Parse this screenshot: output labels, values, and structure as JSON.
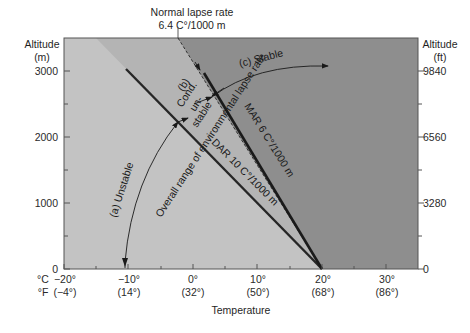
{
  "diagram": {
    "title_annotation": {
      "line1": "Normal lapse rate",
      "line2": "6.4 C°/1000 m"
    },
    "left_axis": {
      "label_line1": "Altitude",
      "label_line2": "(m)",
      "ticks": [
        "0",
        "1000",
        "2000",
        "3000"
      ]
    },
    "right_axis": {
      "label_line1": "Altitude",
      "label_line2": "(ft)",
      "ticks": [
        "0",
        "3280",
        "6560",
        "9840"
      ]
    },
    "bottom_axis": {
      "celsius_unit": "°C",
      "fahrenheit_unit": "°F",
      "celsius_ticks": [
        "−20°",
        "−10°",
        "0°",
        "10°",
        "20°",
        "30°"
      ],
      "fahrenheit_ticks": [
        "(−4°)",
        "(14°)",
        "(32°)",
        "(50°)",
        "(68°)",
        "(86°)"
      ],
      "title": "Temperature"
    },
    "regions": {
      "unstable_label": "(a) Unstable",
      "cond_unstable_label_1": "(b)",
      "cond_unstable_label_2": "Cond.",
      "cond_unstable_label_3": "un-",
      "cond_unstable_label_4": "stable",
      "stable_label": "(c) Stable",
      "overall_range_label": "Overall range of environmental lapse rate"
    },
    "lines": {
      "dar_label": "DAR 10 C°/1000 m",
      "mar_label": "MAR 6 C°/1000 m"
    },
    "colors": {
      "unstable_region": "#c3c3c3",
      "cond_region": "#b4b4b4",
      "stable_region": "#8e8e8e",
      "line": "#262626"
    }
  }
}
